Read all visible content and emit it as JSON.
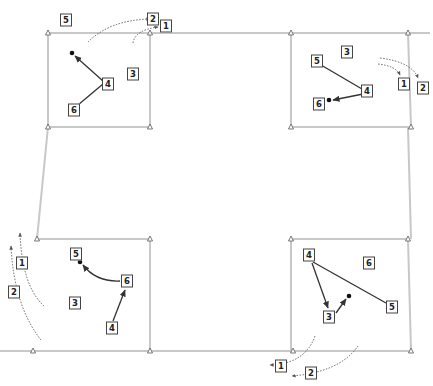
{
  "diagram": {
    "type": "four-panel rotation diagram",
    "colors": {
      "frame": "#c8c8c8",
      "arrow": "#333333",
      "label_border": "#444444"
    },
    "panels": [
      {
        "id": "top-left",
        "labels": [
          {
            "text": "5",
            "x": 66,
            "y": 20
          },
          {
            "text": "4",
            "x": 108,
            "y": 84
          },
          {
            "text": "6",
            "x": 74,
            "y": 110
          },
          {
            "text": "3",
            "x": 133,
            "y": 74
          }
        ],
        "outside_labels": [
          {
            "text": "2",
            "x": 153,
            "y": 19
          },
          {
            "text": "1",
            "x": 166,
            "y": 26
          }
        ]
      },
      {
        "id": "top-right",
        "labels": [
          {
            "text": "5",
            "x": 317,
            "y": 61
          },
          {
            "text": "4",
            "x": 367,
            "y": 91
          },
          {
            "text": "6",
            "x": 319,
            "y": 104
          },
          {
            "text": "3",
            "x": 347,
            "y": 52
          }
        ],
        "outside_labels": [
          {
            "text": "1",
            "x": 404,
            "y": 84
          },
          {
            "text": "2",
            "x": 423,
            "y": 88
          }
        ]
      },
      {
        "id": "bottom-left",
        "labels": [
          {
            "text": "5",
            "x": 76,
            "y": 254
          },
          {
            "text": "6",
            "x": 127,
            "y": 281
          },
          {
            "text": "3",
            "x": 75,
            "y": 303
          },
          {
            "text": "4",
            "x": 112,
            "y": 328
          }
        ],
        "outside_labels": [
          {
            "text": "1",
            "x": 22,
            "y": 263
          },
          {
            "text": "2",
            "x": 14,
            "y": 292
          }
        ]
      },
      {
        "id": "bottom-right",
        "labels": [
          {
            "text": "4",
            "x": 309,
            "y": 255
          },
          {
            "text": "6",
            "x": 369,
            "y": 263
          },
          {
            "text": "5",
            "x": 392,
            "y": 307
          },
          {
            "text": "3",
            "x": 329,
            "y": 317
          }
        ],
        "outside_labels": [
          {
            "text": "1",
            "x": 281,
            "y": 366
          },
          {
            "text": "2",
            "x": 311,
            "y": 373
          }
        ]
      }
    ]
  }
}
